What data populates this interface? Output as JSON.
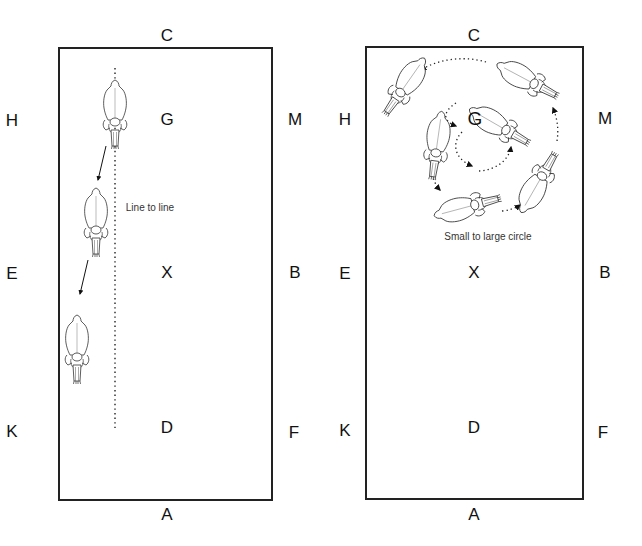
{
  "panels": [
    {
      "id": "left",
      "caption": "Line to line",
      "markers": {
        "C": "C",
        "H": "H",
        "G": "G",
        "M": "M",
        "E": "E",
        "X": "X",
        "B": "B",
        "K": "K",
        "D": "D",
        "F": "F",
        "A": "A"
      },
      "horse_count": 3,
      "line_style": "dotted-straight"
    },
    {
      "id": "right",
      "caption": "Small to large circle",
      "markers": {
        "C": "C",
        "H": "H",
        "G": "G",
        "M": "M",
        "E": "E",
        "X": "X",
        "B": "B",
        "K": "K",
        "D": "D",
        "F": "F",
        "A": "A"
      },
      "horse_count": 6,
      "line_style": "dotted-spiral"
    }
  ],
  "colors": {
    "line": "#222222",
    "text": "#111111",
    "background": "#ffffff"
  }
}
